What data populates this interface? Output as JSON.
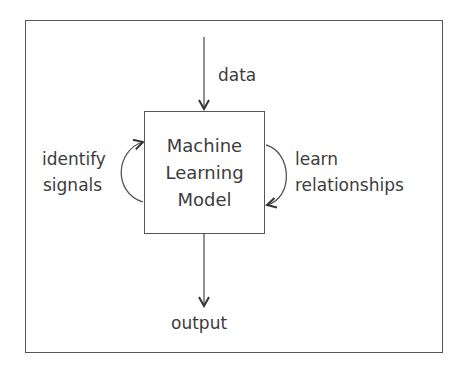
{
  "diagram": {
    "input_label": "data",
    "model_lines": [
      "Machine",
      "Learning",
      "Model"
    ],
    "left_loop_lines": [
      "identify",
      "signals"
    ],
    "right_loop_lines": [
      "learn",
      "relationships"
    ],
    "output_label": "output"
  },
  "colors": {
    "stroke": "#555555",
    "text": "#3c3c3c",
    "background": "#ffffff"
  }
}
